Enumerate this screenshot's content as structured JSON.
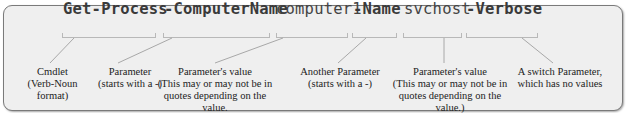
{
  "command": {
    "tokens": [
      {
        "text": "Get-Process",
        "role": "cmdlet",
        "bold": true
      },
      {
        "text": "-ComputerName",
        "role": "parameter",
        "bold": true
      },
      {
        "text": "computer1",
        "role": "value",
        "bold": false
      },
      {
        "text": "-Name",
        "role": "parameter",
        "bold": true
      },
      {
        "text": "svchost",
        "role": "value",
        "bold": false
      },
      {
        "text": "-Verbose",
        "role": "switch",
        "bold": true
      }
    ]
  },
  "annotations": [
    {
      "lines": [
        "Cmdlet",
        "(Verb-Noun",
        "format)"
      ]
    },
    {
      "lines": [
        "Parameter",
        "(starts with a -)"
      ]
    },
    {
      "lines": [
        "Parameter's value",
        "(This may or may not be in",
        "quotes depending on the value."
      ]
    },
    {
      "lines": [
        "Another Parameter",
        "(starts with a -)"
      ]
    },
    {
      "lines": [
        "Parameter's value",
        "(This may or may not be in",
        "quotes depending on the value.)"
      ]
    },
    {
      "lines": [
        "A switch Parameter,",
        "which has no values"
      ]
    }
  ],
  "colors": {
    "background": "#efefef",
    "border": "#7a7a7a",
    "text": "#222222",
    "leader_line": "#a8a8a8"
  }
}
